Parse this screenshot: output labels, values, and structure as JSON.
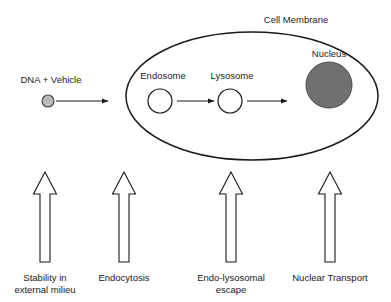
{
  "diagram": {
    "title_visible": false,
    "background_color": "#ffffff",
    "stroke_color": "#1a1a1a",
    "labels": {
      "cell_membrane": "Cell Membrane",
      "nucleus": "Nucleus",
      "endosome": "Endosome",
      "lysosome": "Lysosome",
      "dna_vehicle": "DNA + Vehicle"
    },
    "shapes": {
      "cell_membrane": {
        "name": "cell-membrane-ellipse",
        "cx": 252,
        "cy": 96,
        "rx": 126,
        "ry": 64,
        "fill": "#ffffff",
        "stroke": "#1a1a1a"
      },
      "nucleus": {
        "name": "nucleus-circle",
        "cx": 329,
        "cy": 85,
        "r": 23,
        "fill": "#707070",
        "stroke": "#4a4a4a"
      },
      "endosome": {
        "name": "endosome-circle",
        "cx": 160,
        "cy": 101,
        "r": 12,
        "fill": "#ffffff",
        "stroke": "#1a1a1a"
      },
      "lysosome": {
        "name": "lysosome-circle",
        "cx": 230,
        "cy": 101,
        "r": 12,
        "fill": "#ffffff",
        "stroke": "#1a1a1a"
      },
      "dna_particle": {
        "name": "dna-vehicle-particle",
        "cx": 48,
        "cy": 101,
        "r": 6,
        "fill": "#b9b9b9",
        "stroke": "#4a4a4a"
      }
    },
    "flow_arrows": [
      {
        "name": "arrow-dna-to-cell",
        "x1": 56,
        "y1": 101,
        "x2": 108,
        "y2": 101
      },
      {
        "name": "arrow-endosome-to-lysosome",
        "x1": 177,
        "y1": 101,
        "x2": 214,
        "y2": 101
      },
      {
        "name": "arrow-lysosome-to-nucleus",
        "x1": 247,
        "y1": 101,
        "x2": 287,
        "y2": 101
      }
    ],
    "stage_arrows": [
      {
        "name": "stage-arrow-stability",
        "cx": 45,
        "tip_y": 172,
        "base_y": 262,
        "head_width": 23,
        "head_height": 22,
        "shaft_width": 10,
        "label": "Stability in external milieu",
        "label_lines": [
          "Stability in",
          "external milieu"
        ],
        "label_x": 45,
        "label_y": 272
      },
      {
        "name": "stage-arrow-endocytosis",
        "cx": 124,
        "tip_y": 172,
        "base_y": 262,
        "head_width": 23,
        "head_height": 22,
        "shaft_width": 10,
        "label": "Endocytosis",
        "label_lines": [
          "Endocytosis"
        ],
        "label_x": 124,
        "label_y": 272
      },
      {
        "name": "stage-arrow-endo-lysosomal-escape",
        "cx": 231,
        "tip_y": 172,
        "base_y": 262,
        "head_width": 23,
        "head_height": 22,
        "shaft_width": 10,
        "label": "Endo-lysosomal escape",
        "label_lines": [
          "Endo-lysosomal",
          "escape"
        ],
        "label_x": 231,
        "label_y": 272
      },
      {
        "name": "stage-arrow-nuclear-transport",
        "cx": 330,
        "tip_y": 172,
        "base_y": 262,
        "head_width": 23,
        "head_height": 22,
        "shaft_width": 10,
        "label": "Nuclear Transport",
        "label_lines": [
          "Nuclear Transport"
        ],
        "label_x": 330,
        "label_y": 272
      }
    ],
    "text_positions": {
      "cell_membrane": {
        "x": 296,
        "y": 14
      },
      "nucleus": {
        "x": 329,
        "y": 48
      },
      "endosome": {
        "x": 163,
        "y": 70
      },
      "lysosome": {
        "x": 232,
        "y": 70
      },
      "dna_vehicle": {
        "x": 51,
        "y": 74
      }
    }
  }
}
